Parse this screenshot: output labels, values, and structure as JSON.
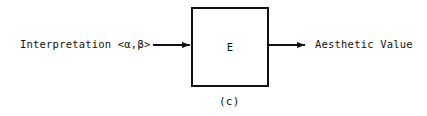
{
  "diagram": {
    "input": {
      "label": "Interpretation <α,β>"
    },
    "block": {
      "label": "E"
    },
    "output": {
      "label": "Aesthetic Value"
    },
    "caption": "(c)",
    "colors": {
      "ink": "#111111",
      "background": "#ffffff"
    }
  }
}
